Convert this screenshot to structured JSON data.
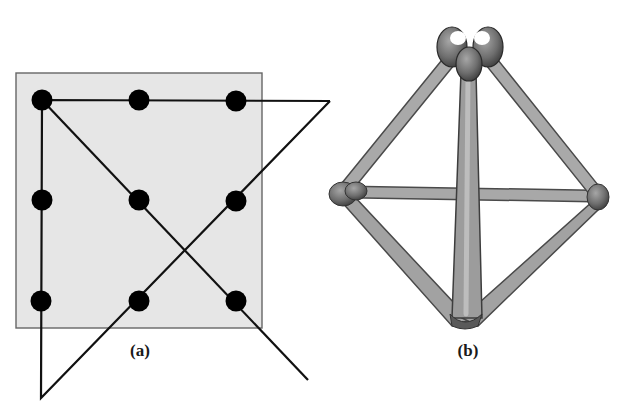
{
  "figure": {
    "panels": [
      {
        "id": "a",
        "label": "(a)",
        "description": "Nine-dot puzzle solved with four connected straight lines extending beyond the square",
        "box": {
          "x": 16,
          "y": 73,
          "width": 246,
          "height": 255,
          "fill": "#e6e6e6",
          "stroke": "#666666"
        },
        "dots": [
          {
            "x": 42,
            "y": 100
          },
          {
            "x": 139,
            "y": 100
          },
          {
            "x": 236,
            "y": 101
          },
          {
            "x": 42,
            "y": 200
          },
          {
            "x": 139,
            "y": 200
          },
          {
            "x": 236,
            "y": 201
          },
          {
            "x": 41,
            "y": 301
          },
          {
            "x": 139,
            "y": 301
          },
          {
            "x": 236,
            "y": 301
          }
        ],
        "dot_radius": 10,
        "dot_color": "#000000",
        "path": [
          {
            "x": 330,
            "y": 101
          },
          {
            "x": 42,
            "y": 100
          },
          {
            "x": 41,
            "y": 398
          },
          {
            "x": 330,
            "y": 101
          }
        ],
        "diagonal": [
          {
            "x": 42,
            "y": 100
          },
          {
            "x": 308,
            "y": 380
          }
        ],
        "label_pos": {
          "x": 140,
          "y": 341
        }
      },
      {
        "id": "b",
        "label": "(b)",
        "description": "Tetrahedron built from six matchsticks forming four equilateral triangles",
        "vertices": {
          "top": {
            "x": 468,
            "y": 55
          },
          "left": {
            "x": 342,
            "y": 193
          },
          "right": {
            "x": 598,
            "y": 196
          },
          "bottom": {
            "x": 465,
            "y": 324
          }
        },
        "stick_color": "#9a9a9a",
        "node_color": "#6f6f6f",
        "label_pos": {
          "x": 468,
          "y": 341
        }
      }
    ]
  }
}
